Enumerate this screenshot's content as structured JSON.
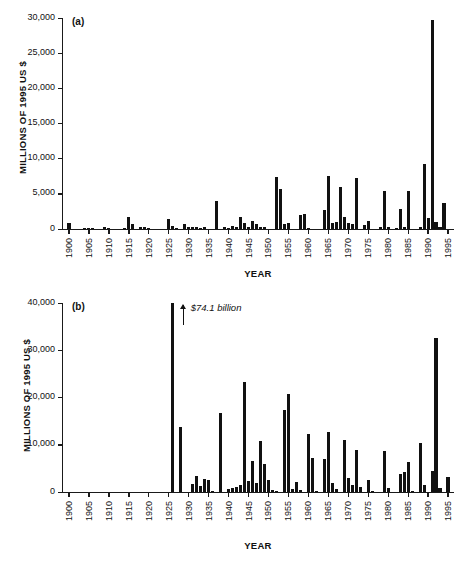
{
  "figure": {
    "background": "#ffffff",
    "ink_color": "#111111"
  },
  "chart_data": [
    {
      "id": "panel-a",
      "type": "bar",
      "panel_label": "(a)",
      "title": "",
      "xlabel": "YEAR",
      "ylabel": "MILLIONS OF 1995 US $",
      "ylim": [
        0,
        30000
      ],
      "xlim": [
        1898.5,
        1996.5
      ],
      "grid": false,
      "legend": false,
      "ytick_labels": [
        "0",
        "5,000",
        "10,000",
        "15,000",
        "20,000",
        "25,000",
        "30,000"
      ],
      "ytick_values": [
        0,
        5000,
        10000,
        15000,
        20000,
        25000,
        30000
      ],
      "xtick_labels": [
        "1900",
        "1905",
        "1910",
        "1915",
        "1920",
        "1925",
        "1930",
        "1935",
        "1940",
        "1945",
        "1950",
        "1955",
        "1960",
        "1965",
        "1970",
        "1975",
        "1980",
        "1985",
        "1990",
        "1995"
      ],
      "xtick_values": [
        1900,
        1905,
        1910,
        1915,
        1920,
        1925,
        1930,
        1935,
        1940,
        1945,
        1950,
        1955,
        1960,
        1965,
        1970,
        1975,
        1980,
        1985,
        1990,
        1995
      ],
      "x": [
        1900,
        1904,
        1905,
        1906,
        1909,
        1910,
        1914,
        1915,
        1916,
        1918,
        1919,
        1920,
        1925,
        1926,
        1927,
        1929,
        1930,
        1931,
        1932,
        1933,
        1934,
        1937,
        1939,
        1940,
        1941,
        1942,
        1943,
        1944,
        1945,
        1946,
        1947,
        1948,
        1949,
        1952,
        1953,
        1954,
        1955,
        1958,
        1959,
        1960,
        1964,
        1965,
        1966,
        1967,
        1968,
        1969,
        1970,
        1971,
        1972,
        1974,
        1975,
        1978,
        1979,
        1980,
        1982,
        1983,
        1984,
        1985,
        1988,
        1989,
        1990,
        1991,
        1992,
        1993,
        1994,
        1995
      ],
      "values": [
        800,
        120,
        130,
        100,
        220,
        90,
        170,
        1700,
        750,
        280,
        230,
        120,
        1450,
        360,
        190,
        700,
        220,
        280,
        300,
        200,
        250,
        4050,
        220,
        200,
        450,
        300,
        1700,
        900,
        250,
        1100,
        700,
        350,
        280,
        7400,
        5650,
        750,
        900,
        2050,
        2100,
        120,
        2700,
        7500,
        850,
        1000,
        6000,
        1700,
        850,
        700,
        7300,
        500,
        1100,
        250,
        5450,
        250,
        180,
        2800,
        220,
        5450,
        230,
        9200,
        1600,
        29700,
        950,
        230,
        3750
      ]
    },
    {
      "id": "panel-b",
      "type": "bar",
      "panel_label": "(b)",
      "title": "",
      "xlabel": "YEAR",
      "ylabel": "MILLIONS OF 1995 US $",
      "ylim": [
        0,
        40000
      ],
      "xlim": [
        1898.5,
        1996.5
      ],
      "grid": false,
      "legend": false,
      "annotation": {
        "text": "$74.1 billion",
        "points_to_year": 1926,
        "points_to_value": 74100
      },
      "ytick_labels": [
        "0",
        "10,000",
        "20,000",
        "30,000",
        "40,000"
      ],
      "ytick_values": [
        0,
        10000,
        20000,
        30000,
        40000
      ],
      "xtick_labels": [
        "1900",
        "1905",
        "1910",
        "1915",
        "1920",
        "1925",
        "1930",
        "1935",
        "1940",
        "1945",
        "1950",
        "1955",
        "1960",
        "1965",
        "1970",
        "1975",
        "1980",
        "1985",
        "1990",
        "1995"
      ],
      "xtick_values": [
        1900,
        1905,
        1910,
        1915,
        1920,
        1925,
        1930,
        1935,
        1940,
        1945,
        1950,
        1955,
        1960,
        1965,
        1970,
        1975,
        1980,
        1985,
        1990,
        1995
      ],
      "x": [
        1926,
        1928,
        1931,
        1932,
        1933,
        1934,
        1935,
        1936,
        1938,
        1940,
        1941,
        1942,
        1943,
        1944,
        1945,
        1946,
        1947,
        1948,
        1949,
        1950,
        1951,
        1952,
        1954,
        1955,
        1956,
        1957,
        1958,
        1960,
        1961,
        1962,
        1964,
        1965,
        1966,
        1967,
        1969,
        1970,
        1971,
        1972,
        1973,
        1975,
        1976,
        1979,
        1980,
        1983,
        1984,
        1985,
        1986,
        1988,
        1989,
        1991,
        1992,
        1993,
        1995
      ],
      "values": [
        40000,
        13800,
        1700,
        3300,
        1200,
        2800,
        2600,
        200,
        16700,
        700,
        800,
        1100,
        1500,
        23200,
        2300,
        6600,
        1900,
        10800,
        6000,
        2600,
        400,
        300,
        17400,
        20700,
        600,
        2100,
        400,
        12200,
        7200,
        300,
        7000,
        12700,
        1900,
        600,
        11000,
        3000,
        1500,
        8800,
        1100,
        2600,
        200,
        8600,
        800,
        3900,
        4200,
        6300,
        200,
        10300,
        1400,
        4500,
        32700,
        800,
        3200
      ]
    }
  ]
}
